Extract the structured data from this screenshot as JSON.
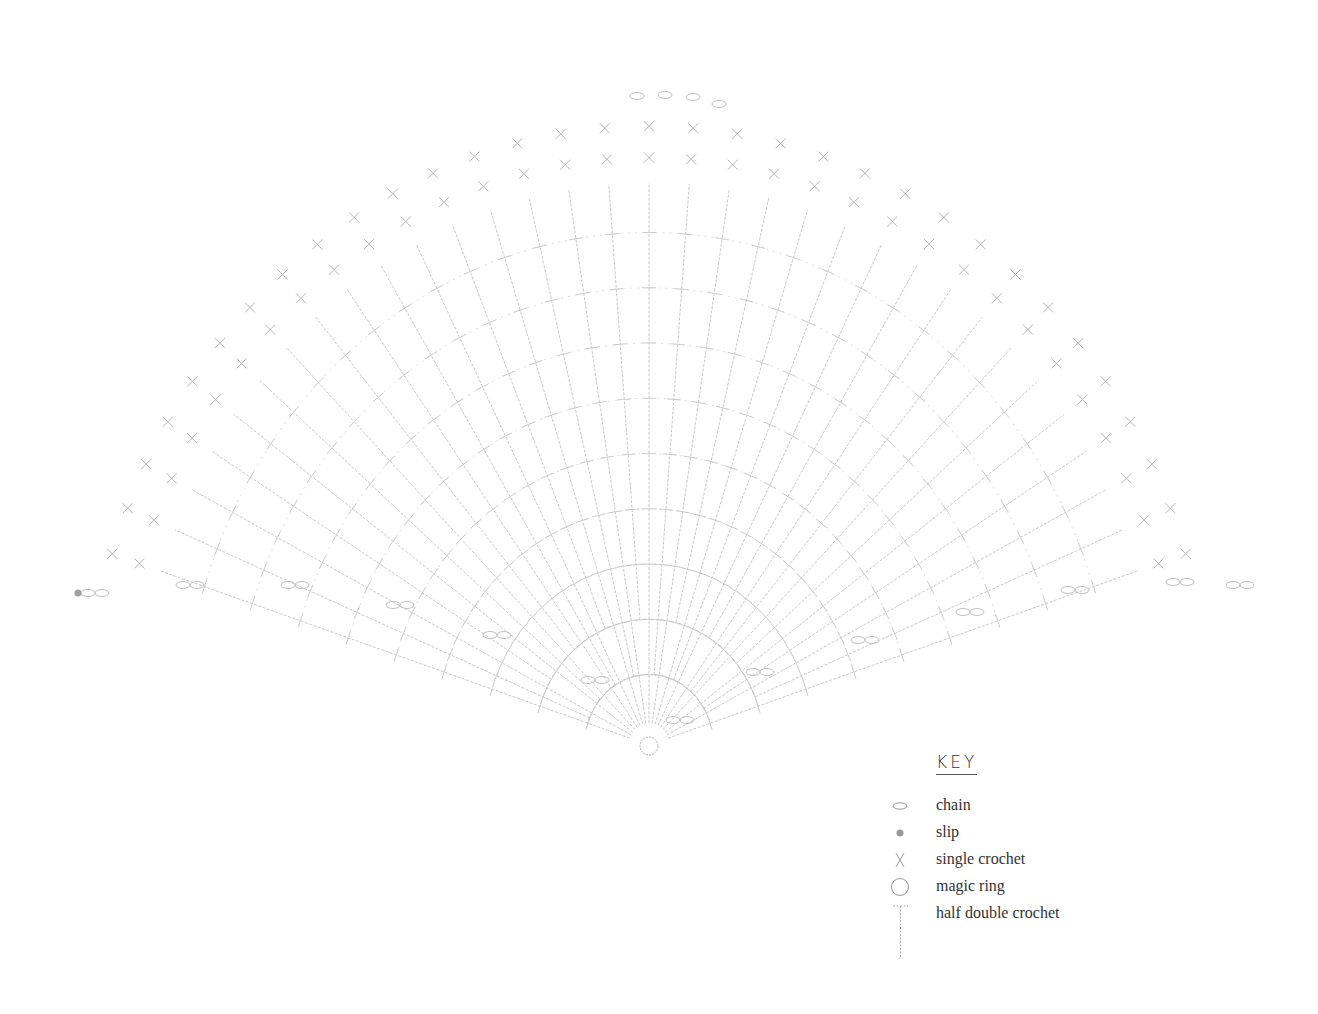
{
  "chart_data": {
    "type": "crochet-chart",
    "shape": "fan",
    "center": [
      649,
      745
    ],
    "stroke_color": "#c8c8c8",
    "rays": 33,
    "angle_start_deg": 162,
    "angle_end_deg": 18,
    "ray_inner_radius": 20,
    "ray_outer_radius_x": 570,
    "ray_outer_radius_y": 625,
    "rings": [
      70,
      125,
      180,
      235,
      290,
      345,
      400,
      455,
      510
    ],
    "chain_loops_bottom": [
      [
        95,
        593
      ],
      [
        190,
        585
      ],
      [
        295,
        585
      ],
      [
        400,
        605
      ],
      [
        497,
        635
      ],
      [
        595,
        680
      ],
      [
        680,
        720
      ],
      [
        760,
        672
      ],
      [
        865,
        640
      ],
      [
        970,
        612
      ],
      [
        1075,
        590
      ],
      [
        1180,
        582
      ],
      [
        1240,
        585
      ]
    ],
    "top_chains": [
      [
        637,
        96
      ],
      [
        665,
        95
      ],
      [
        693,
        97
      ],
      [
        719,
        104
      ]
    ],
    "slip_stitch": [
      78,
      593
    ],
    "magic_ring": {
      "cx": 649,
      "cy": 746,
      "r": 9
    }
  },
  "key": {
    "title": "KEY",
    "items": [
      {
        "symbol": "chain-icon",
        "label": "chain"
      },
      {
        "symbol": "slip-icon",
        "label": "slip"
      },
      {
        "symbol": "single-crochet-icon",
        "label": "single crochet"
      },
      {
        "symbol": "magic-ring-icon",
        "label": "magic ring"
      },
      {
        "symbol": "half-double-crochet-icon",
        "label": "half double crochet"
      }
    ]
  }
}
